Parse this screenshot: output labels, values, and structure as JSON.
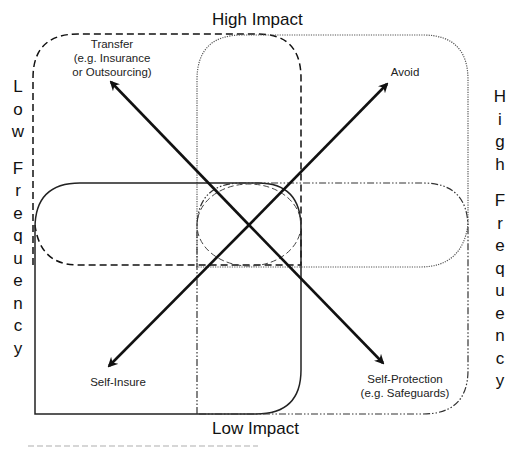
{
  "diagram": {
    "axes": {
      "top": "High Impact",
      "bottom": "Low Impact",
      "left": "Low Frequency",
      "right": "High Frequency",
      "left_letters": [
        "L",
        "o",
        "w",
        "",
        "F",
        "r",
        "e",
        "q",
        "u",
        "e",
        "n",
        "c",
        "y"
      ],
      "right_letters": [
        "H",
        "i",
        "g",
        "h",
        "",
        "F",
        "r",
        "e",
        "q",
        "u",
        "e",
        "n",
        "c",
        "y"
      ]
    },
    "strategies": [
      {
        "id": "transfer",
        "line1": "Transfer",
        "line2": "(e.g. Insurance",
        "line3": "or Outsourcing)",
        "quadrant": "high-impact-low-frequency",
        "outline": "dashed"
      },
      {
        "id": "avoid",
        "line1": "Avoid",
        "quadrant": "high-impact-high-frequency",
        "outline": "dotted"
      },
      {
        "id": "self-insure",
        "line1": "Self-Insure",
        "quadrant": "low-impact-low-frequency",
        "outline": "solid"
      },
      {
        "id": "self-protection",
        "line1": "Self-Protection",
        "line2": "(e.g. Safeguards)",
        "quadrant": "low-impact-high-frequency",
        "outline": "dash-dot"
      }
    ],
    "colors": {
      "background": "#ffffff",
      "stroke": "#111111",
      "dotted_stroke": "#555555",
      "text": "#1a1a1a"
    }
  }
}
